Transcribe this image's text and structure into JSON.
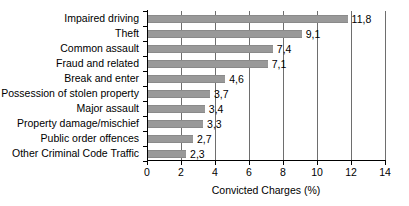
{
  "chart_data": {
    "type": "bar",
    "orientation": "horizontal",
    "title": "",
    "xlabel": "Convicted Charges (%)",
    "ylabel": "",
    "xlim": [
      0,
      14
    ],
    "xticks": [
      0,
      2,
      4,
      6,
      8,
      10,
      12,
      14
    ],
    "xtick_labels": [
      "0",
      "2",
      "4",
      "6",
      "8",
      "10",
      "12",
      "14"
    ],
    "grid": "vertical",
    "legend": "none",
    "decimal_separator": ",",
    "bar_color": "#999999",
    "categories": [
      "Impaired driving",
      "Theft",
      "Common assault",
      "Fraud and related",
      "Break and enter",
      "Possession of stolen property",
      "Major assault",
      "Property damage/mischief",
      "Public order offences",
      "Other Criminal Code Traffic"
    ],
    "values": [
      11.8,
      9.1,
      7.4,
      7.1,
      4.6,
      3.7,
      3.4,
      3.3,
      2.7,
      2.3
    ],
    "value_labels": [
      "11,8",
      "9,1",
      "7,4",
      "7,1",
      "4,6",
      "3,7",
      "3,4",
      "3,3",
      "2,7",
      "2,3"
    ]
  }
}
